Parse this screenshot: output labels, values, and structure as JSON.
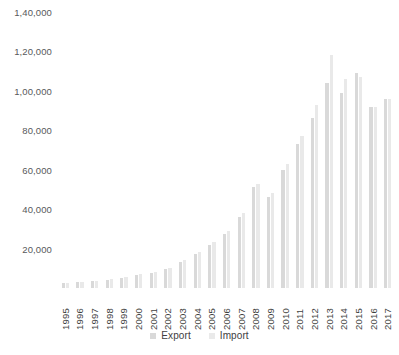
{
  "chart_data": {
    "type": "bar",
    "title": "",
    "subtitle": "",
    "xlabel": "",
    "ylabel": "",
    "grid": false,
    "legend_position": "bottom-center",
    "ylim": [
      0,
      140000
    ],
    "ytick_values": [
      20000,
      40000,
      60000,
      80000,
      100000,
      120000,
      140000
    ],
    "ytick_labels": [
      "20,000",
      "40,000",
      "60,000",
      "80,000",
      "1,00,000",
      "1,20,000",
      "1,40,000"
    ],
    "categories": [
      "1995",
      "1996",
      "1997",
      "1998",
      "1999",
      "2000",
      "2001",
      "2002",
      "2003",
      "2004",
      "2005",
      "2006",
      "2007",
      "2008",
      "2009",
      "2010",
      "2011",
      "2012",
      "2013",
      "2014",
      "2015",
      "2016",
      "2017"
    ],
    "series": [
      {
        "name": "Export",
        "color": "#d9d9d9",
        "values": [
          2400,
          2900,
          3400,
          4200,
          5200,
          6500,
          7600,
          9500,
          13000,
          17500,
          22000,
          27500,
          36000,
          51000,
          46000,
          60000,
          73000,
          86000,
          104000,
          99000,
          109000,
          92000,
          96000
        ]
      },
      {
        "name": "Import",
        "color": "#e9e9e9",
        "values": [
          2600,
          3100,
          3700,
          4600,
          5600,
          7000,
          8200,
          10200,
          14000,
          18500,
          23500,
          29000,
          38000,
          53000,
          48000,
          63000,
          77000,
          93000,
          118000,
          106000,
          107000,
          92000,
          96000
        ]
      }
    ],
    "legend": [
      "Export",
      "Import"
    ]
  },
  "legend": {
    "export_label": "Export",
    "import_label": "Import"
  },
  "caption": {
    "text": ""
  },
  "colors": {
    "export": "#d9d9d9",
    "import": "#e9e9e9",
    "axis_text": "#3f3f41",
    "background": "#ffffff"
  }
}
